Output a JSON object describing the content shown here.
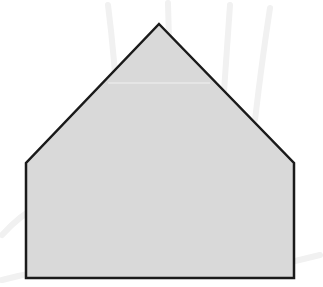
{
  "figure": {
    "shape": "pentagon",
    "vertices": [
      {
        "name": "apex",
        "x": 159,
        "y": 24
      },
      {
        "name": "right-shoulder",
        "x": 294,
        "y": 163
      },
      {
        "name": "bottom-right",
        "x": 294,
        "y": 278
      },
      {
        "name": "bottom-left",
        "x": 26,
        "y": 278
      },
      {
        "name": "left-shoulder",
        "x": 26,
        "y": 163
      }
    ],
    "colors": {
      "fill": "#d9d9d9",
      "stroke": "#1a1a1a",
      "highlight_line": "#f2f2f2",
      "watermark": "#f1f1f1",
      "background": "#ffffff"
    },
    "stroke_width": 2.5
  }
}
